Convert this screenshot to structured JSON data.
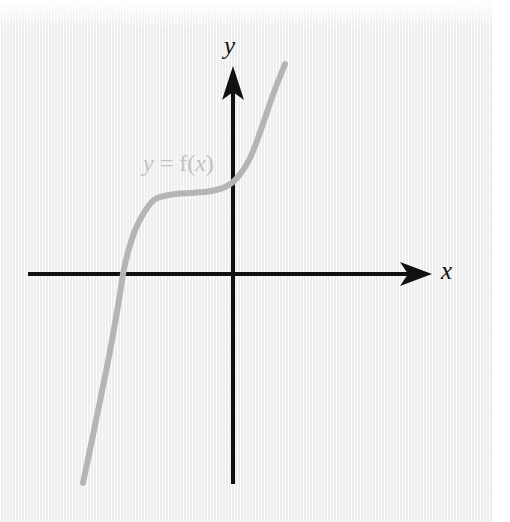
{
  "figure": {
    "kind": "cartesian-graph",
    "background_color": "#f4f4f4",
    "page_margin_color": "#ffffff",
    "curve_label": {
      "full_text": "y = f(x)",
      "lhs_variable": "y",
      "equals": " = ",
      "function_name": "f",
      "open_paren": "(",
      "argument": "x",
      "close_paren": ")",
      "color": "#c2c2c2"
    },
    "axes": {
      "x_label": "x",
      "y_label": "y",
      "color": "#111111",
      "x_arrow_icon": "arrow-right-icon",
      "y_arrow_icon": "arrow-up-icon"
    }
  },
  "chart_data": {
    "type": "line",
    "title": "",
    "subtitle": "",
    "xlabel": "x",
    "ylabel": "y",
    "grid": false,
    "legend": null,
    "annotations": [
      {
        "text": "y = f(x)",
        "x": -2.6,
        "y": 2.4,
        "color": "#c2c2c2"
      }
    ],
    "axis_origin_px": [
      233,
      274
    ],
    "xlim": [
      -5.5,
      5.0
    ],
    "ylim": [
      -5.5,
      5.5
    ],
    "series": [
      {
        "name": "y = f(x)",
        "color": "#b5b5b5",
        "linewidth_px": 6,
        "description": "cubic-like increasing curve with a flat inflection plateau left of the y-axis",
        "points_px": [
          [
            83,
            483
          ],
          [
            92,
            440
          ],
          [
            101,
            396
          ],
          [
            110,
            351
          ],
          [
            119,
            300
          ],
          [
            123,
            274
          ],
          [
            128,
            252
          ],
          [
            136,
            228
          ],
          [
            145,
            211
          ],
          [
            154,
            200
          ],
          [
            164,
            196
          ],
          [
            176,
            194
          ],
          [
            190,
            193
          ],
          [
            204,
            192
          ],
          [
            216,
            190
          ],
          [
            225,
            187
          ],
          [
            233,
            182
          ],
          [
            241,
            173
          ],
          [
            249,
            160
          ],
          [
            257,
            141
          ],
          [
            265,
            118
          ],
          [
            274,
            92
          ],
          [
            285,
            64
          ]
        ],
        "x_intercept_px": [
          123,
          274
        ],
        "y_intercept_px": [
          233,
          182
        ],
        "endpoint_start_px": [
          83,
          483
        ],
        "endpoint_end_px": [
          285,
          64
        ]
      }
    ]
  }
}
